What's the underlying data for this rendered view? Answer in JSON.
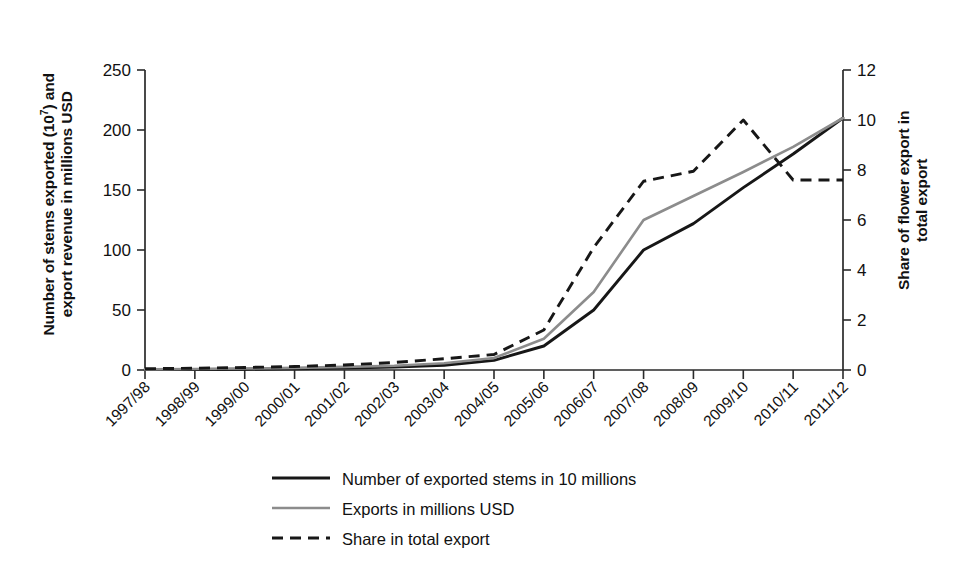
{
  "chart_data": {
    "type": "line",
    "title": "",
    "subtitle": "",
    "xlabel": "",
    "ylabel": "Number of stems exported (10^7) and export revenue in millions USD",
    "ylabel_secondary": "Share of flower export in total export",
    "grid": false,
    "legend_position": "bottom",
    "categories": [
      "1997/98",
      "1998/99",
      "1999/00",
      "2000/01",
      "2001/02",
      "2002/03",
      "2003/04",
      "2004/05",
      "2005/06",
      "2006/07",
      "2007/08",
      "2008/09",
      "2009/10",
      "2010/11",
      "2011/12"
    ],
    "ylim": [
      0,
      250
    ],
    "yticks": [
      0,
      50,
      100,
      150,
      200,
      250
    ],
    "ylim_secondary": [
      0,
      12
    ],
    "yticks_secondary": [
      0,
      2,
      4,
      6,
      8,
      10,
      12
    ],
    "series": [
      {
        "name": "Number of exported stems in 10 millions",
        "axis": "left",
        "style": "solid",
        "color": "#171717",
        "values": [
          0.3,
          0.4,
          0.6,
          1.0,
          1.6,
          2.4,
          4.0,
          8.0,
          20.0,
          50.0,
          100.0,
          122.0,
          152.0,
          180.0,
          210.0
        ]
      },
      {
        "name": "Exports in millions USD",
        "axis": "left",
        "style": "solid",
        "color": "#8c8c8c",
        "values": [
          0.5,
          0.8,
          1.2,
          1.8,
          2.6,
          3.6,
          5.6,
          10.0,
          26.0,
          65.0,
          125.0,
          145.0,
          165.0,
          186.0,
          210.0
        ]
      },
      {
        "name": "Share in total export",
        "axis": "right",
        "style": "dashed",
        "color": "#171717",
        "values": [
          0.05,
          0.07,
          0.1,
          0.14,
          0.2,
          0.3,
          0.45,
          0.62,
          1.6,
          4.9,
          7.55,
          7.95,
          10.0,
          7.6,
          7.6
        ]
      }
    ]
  },
  "axes": {
    "left_label_line1": "Number of stems exported (10",
    "left_label_sup": "7",
    "left_label_line1_end": ") and",
    "left_label_line2": "export revenue in millions USD",
    "right_label_line1": "Share of flower export in",
    "right_label_line2": "total export"
  },
  "legend": {
    "items": [
      {
        "label": "Number of exported stems in 10 millions",
        "style": "solid",
        "color": "#171717"
      },
      {
        "label": "Exports in millions USD",
        "style": "solid",
        "color": "#8c8c8c"
      },
      {
        "label": "Share in total export",
        "style": "dashed",
        "color": "#171717"
      }
    ]
  },
  "colors": {
    "axis": "#2b2b2b",
    "text": "#111111",
    "series_stems": "#171717",
    "series_exports": "#8c8c8c",
    "series_share": "#171717",
    "background": "#ffffff"
  }
}
